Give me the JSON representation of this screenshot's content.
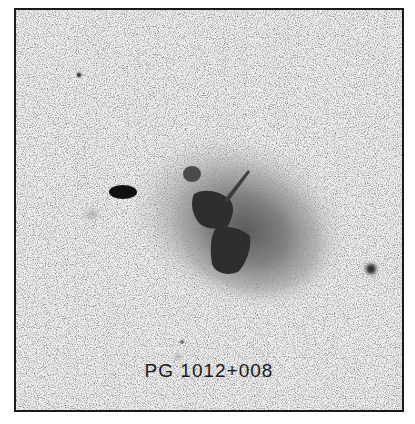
{
  "figure": {
    "object_label": "PG 1012+008",
    "colors": {
      "background": "#f4f4f4",
      "frame": "#1a1a1a",
      "halo": "#6e6e6e",
      "core": "#2e2e2e",
      "label": "#1a1a1a"
    }
  }
}
